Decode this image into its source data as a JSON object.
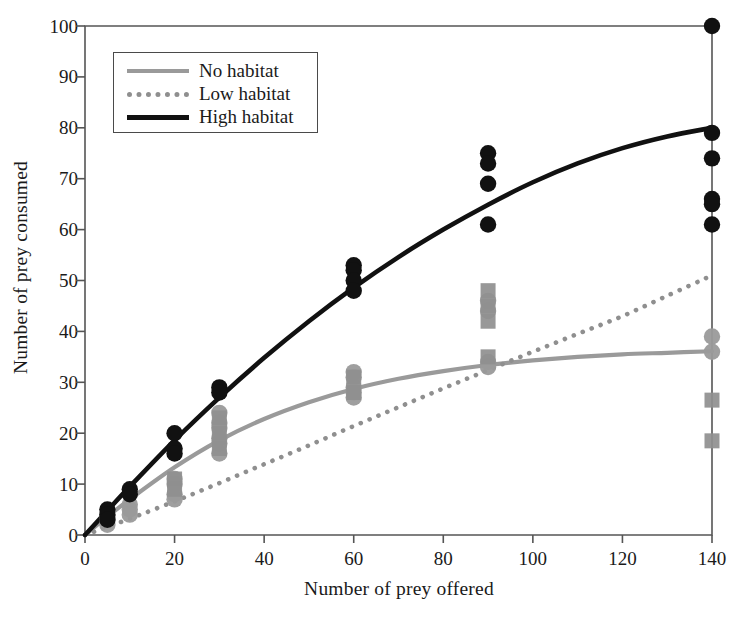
{
  "chart_data": {
    "type": "scatter",
    "title": "",
    "xlabel": "Number of prey offered",
    "ylabel": "Number of prey consumed",
    "xlim": [
      0,
      140
    ],
    "ylim": [
      0,
      100
    ],
    "xticks": [
      0,
      20,
      40,
      60,
      80,
      100,
      120,
      140
    ],
    "yticks": [
      0,
      10,
      20,
      30,
      40,
      50,
      60,
      70,
      80,
      90,
      100
    ],
    "grid": false,
    "legend_position": "upper left",
    "legend_entries": [
      "No habitat",
      "Low habitat",
      "High habitat"
    ],
    "series": [
      {
        "name": "No habitat",
        "color": "#9a9a9a",
        "line_style": "solid",
        "marker": "circle",
        "points": [
          {
            "x": 5,
            "y": 4
          },
          {
            "x": 5,
            "y": 3
          },
          {
            "x": 5,
            "y": 2
          },
          {
            "x": 10,
            "y": 6
          },
          {
            "x": 10,
            "y": 5
          },
          {
            "x": 10,
            "y": 4
          },
          {
            "x": 20,
            "y": 11
          },
          {
            "x": 20,
            "y": 10
          },
          {
            "x": 20,
            "y": 8
          },
          {
            "x": 20,
            "y": 7
          },
          {
            "x": 30,
            "y": 24
          },
          {
            "x": 30,
            "y": 22
          },
          {
            "x": 30,
            "y": 21
          },
          {
            "x": 30,
            "y": 19
          },
          {
            "x": 30,
            "y": 18
          },
          {
            "x": 30,
            "y": 16
          },
          {
            "x": 60,
            "y": 32
          },
          {
            "x": 60,
            "y": 31
          },
          {
            "x": 60,
            "y": 29
          },
          {
            "x": 60,
            "y": 28
          },
          {
            "x": 60,
            "y": 27
          },
          {
            "x": 90,
            "y": 46
          },
          {
            "x": 90,
            "y": 44
          },
          {
            "x": 90,
            "y": 34
          },
          {
            "x": 90,
            "y": 33
          },
          {
            "x": 140,
            "y": 39
          },
          {
            "x": 140,
            "y": 36
          }
        ],
        "fit_curve": {
          "x": [
            0,
            5,
            10,
            20,
            30,
            40,
            50,
            60,
            70,
            80,
            90,
            100,
            110,
            120,
            130,
            140
          ],
          "y": [
            0,
            3.6,
            7.0,
            13.3,
            18.6,
            22.8,
            26.1,
            28.7,
            30.7,
            32.2,
            33.4,
            34.3,
            35.0,
            35.5,
            35.8,
            36.1
          ]
        }
      },
      {
        "name": "Low habitat",
        "color": "#8f8f8f",
        "line_style": "dotted",
        "marker": "square",
        "points": [
          {
            "x": 20,
            "y": 11
          },
          {
            "x": 20,
            "y": 9
          },
          {
            "x": 30,
            "y": 23
          },
          {
            "x": 30,
            "y": 20
          },
          {
            "x": 30,
            "y": 17
          },
          {
            "x": 60,
            "y": 31
          },
          {
            "x": 60,
            "y": 28
          },
          {
            "x": 90,
            "y": 48
          },
          {
            "x": 90,
            "y": 45
          },
          {
            "x": 90,
            "y": 42
          },
          {
            "x": 90,
            "y": 35
          },
          {
            "x": 140,
            "y": 26.5
          },
          {
            "x": 140,
            "y": 18.5
          }
        ],
        "fit_curve": {
          "x": [
            0,
            5,
            10,
            20,
            30,
            40,
            50,
            60,
            70,
            80,
            90,
            100,
            110,
            120,
            130,
            140
          ],
          "y": [
            0,
            1.6,
            3.2,
            6.6,
            10.2,
            13.9,
            17.6,
            21.4,
            25.1,
            28.8,
            32.4,
            36.0,
            39.5,
            43.0,
            47.0,
            51.0
          ]
        }
      },
      {
        "name": "High habitat",
        "color": "#111111",
        "line_style": "solid",
        "marker": "circle",
        "points": [
          {
            "x": 5,
            "y": 5
          },
          {
            "x": 5,
            "y": 4
          },
          {
            "x": 5,
            "y": 3
          },
          {
            "x": 10,
            "y": 9
          },
          {
            "x": 10,
            "y": 8
          },
          {
            "x": 20,
            "y": 20
          },
          {
            "x": 20,
            "y": 17
          },
          {
            "x": 20,
            "y": 16
          },
          {
            "x": 30,
            "y": 29
          },
          {
            "x": 30,
            "y": 28
          },
          {
            "x": 60,
            "y": 53
          },
          {
            "x": 60,
            "y": 52
          },
          {
            "x": 60,
            "y": 50
          },
          {
            "x": 60,
            "y": 48
          },
          {
            "x": 90,
            "y": 75
          },
          {
            "x": 90,
            "y": 73
          },
          {
            "x": 90,
            "y": 69
          },
          {
            "x": 90,
            "y": 61
          },
          {
            "x": 140,
            "y": 100
          },
          {
            "x": 140,
            "y": 79
          },
          {
            "x": 140,
            "y": 74
          },
          {
            "x": 140,
            "y": 66
          },
          {
            "x": 140,
            "y": 65
          },
          {
            "x": 140,
            "y": 61
          }
        ],
        "fit_curve": {
          "x": [
            0,
            5,
            10,
            20,
            30,
            40,
            50,
            60,
            70,
            80,
            90,
            100,
            110,
            120,
            130,
            140
          ],
          "y": [
            0,
            4.8,
            9.5,
            18.6,
            27.0,
            34.8,
            42.0,
            48.6,
            54.6,
            60.0,
            64.9,
            69.3,
            73.0,
            76.0,
            78.3,
            80.0
          ]
        }
      }
    ]
  },
  "axes": {
    "x_title": "Number of prey offered",
    "y_title": "Number of prey consumed",
    "x_tick_labels": [
      "0",
      "20",
      "40",
      "60",
      "80",
      "100",
      "120",
      "140"
    ],
    "y_tick_labels": [
      "0",
      "10",
      "20",
      "30",
      "40",
      "50",
      "60",
      "70",
      "80",
      "90",
      "100"
    ]
  },
  "legend": {
    "items": [
      {
        "label": "No habitat",
        "swatch": "solid-gray-line"
      },
      {
        "label": "Low habitat",
        "swatch": "dotted-gray-line"
      },
      {
        "label": "High habitat",
        "swatch": "solid-black-line"
      }
    ]
  },
  "colors": {
    "no_habitat": "#9a9a9a",
    "low_habitat": "#8f8f8f",
    "high_habitat": "#111111",
    "axis": "#555555",
    "background": "#ffffff"
  }
}
